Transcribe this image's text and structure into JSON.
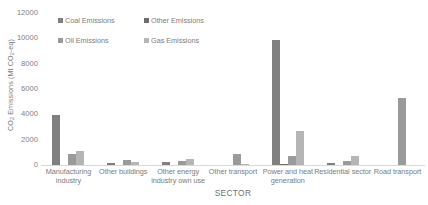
{
  "chart_data": {
    "type": "bar",
    "title": "",
    "subtitle": "",
    "xlabel": "SECTOR",
    "ylabel": "CO2 Emissions (Mt CO2-eq)",
    "ylabel_parts": {
      "prefix": "CO",
      "sub1": "2",
      "middle": " Emissions (Mt CO",
      "sub2": "2",
      "suffix": "-eq)"
    },
    "ylim": [
      0,
      12000
    ],
    "ytick_values": [
      0,
      2000,
      4000,
      6000,
      8000,
      10000,
      12000
    ],
    "ytick_labels": [
      "0",
      "2000",
      "4000",
      "6000",
      "8000",
      "10000",
      "12000"
    ],
    "grid": false,
    "legend_position": "top-center-inside",
    "categories": [
      "Manufacturing industry",
      "Other buildings",
      "Other energy industry own use",
      "Other transport",
      "Power and heat generation",
      "Residential sector",
      "Road transport"
    ],
    "series": [
      {
        "name": "Coal Emissions",
        "color": "#808080",
        "values": [
          3950,
          150,
          200,
          0,
          9900,
          150,
          0
        ]
      },
      {
        "name": "Other Emissions",
        "color": "#6d6d6d",
        "values": [
          0,
          0,
          0,
          0,
          60,
          0,
          0
        ]
      },
      {
        "name": "Oil Emissions",
        "color": "#9a9a9a",
        "values": [
          900,
          400,
          350,
          850,
          700,
          350,
          5300
        ]
      },
      {
        "name": "Gas Emissions",
        "color": "#b5b5b5",
        "values": [
          1100,
          250,
          450,
          60,
          2700,
          700,
          0
        ]
      }
    ]
  },
  "legend": {
    "items": [
      {
        "label": "Coal Emissions",
        "color": "#808080"
      },
      {
        "label": "Other Emissions",
        "color": "#6d6d6d"
      },
      {
        "label": "Oil Emissions",
        "color": "#9a9a9a"
      },
      {
        "label": "Gas Emissions",
        "color": "#b5b5b5"
      }
    ]
  },
  "colors": {
    "axis_line": "#d9d9d9",
    "tick_text": "#808080",
    "label_text": "#7c7c7c",
    "background": "#ffffff"
  }
}
